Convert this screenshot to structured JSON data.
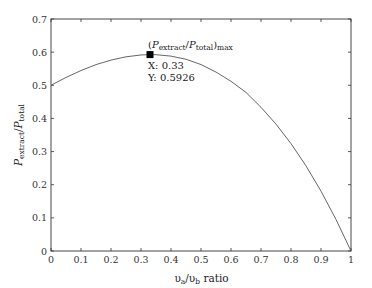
{
  "chart_data": {
    "type": "line",
    "title": "",
    "xlabel": "υa/υb ratio",
    "xlabel_parts": {
      "v": "υ",
      "a": "a",
      "slash": "/",
      "b": "b",
      "rest": " ratio"
    },
    "ylabel": "P_extract/P_total",
    "ylabel_parts": {
      "P1": "P",
      "sub1": "extract",
      "slash": "/",
      "P2": "P",
      "sub2": "total"
    },
    "xlim": [
      0,
      1
    ],
    "ylim": [
      0,
      0.7
    ],
    "grid": false,
    "legend": null,
    "x_ticks": [
      "0",
      "0.1",
      "0.2",
      "0.3",
      "0.4",
      "0.5",
      "0.6",
      "0.7",
      "0.8",
      "0.9",
      "1"
    ],
    "y_ticks": [
      "0",
      "0.1",
      "0.2",
      "0.3",
      "0.4",
      "0.5",
      "0.6",
      "0.7"
    ],
    "series": [
      {
        "name": "P_extract/P_total",
        "x": [
          0,
          0.05,
          0.1,
          0.15,
          0.2,
          0.25,
          0.3,
          0.333,
          0.35,
          0.4,
          0.45,
          0.5,
          0.55,
          0.6,
          0.65,
          0.7,
          0.75,
          0.8,
          0.85,
          0.9,
          0.95,
          1.0
        ],
        "values": [
          0.5,
          0.5236,
          0.5445,
          0.5624,
          0.576,
          0.5859,
          0.5915,
          0.5926,
          0.5923,
          0.588,
          0.5786,
          0.5625,
          0.5398,
          0.512,
          0.4784,
          0.4335,
          0.3828,
          0.324,
          0.2569,
          0.1805,
          0.0951,
          0.0
        ]
      }
    ],
    "annotations": [
      {
        "type": "marker",
        "x": 0.33,
        "y": 0.5926,
        "label": "(P_extract/P_total)_max",
        "label_parts": {
          "open": "(",
          "P1": "P",
          "sub1": "extract",
          "slash": "/",
          "P2": "P",
          "sub2": "total",
          "close": ")",
          "sub3": "max"
        },
        "x_text": "X: 0.33",
        "y_text": "Y: 0.5926"
      }
    ],
    "colors": {
      "line": "#555555",
      "marker": "#000000",
      "axis": "#333333"
    }
  }
}
